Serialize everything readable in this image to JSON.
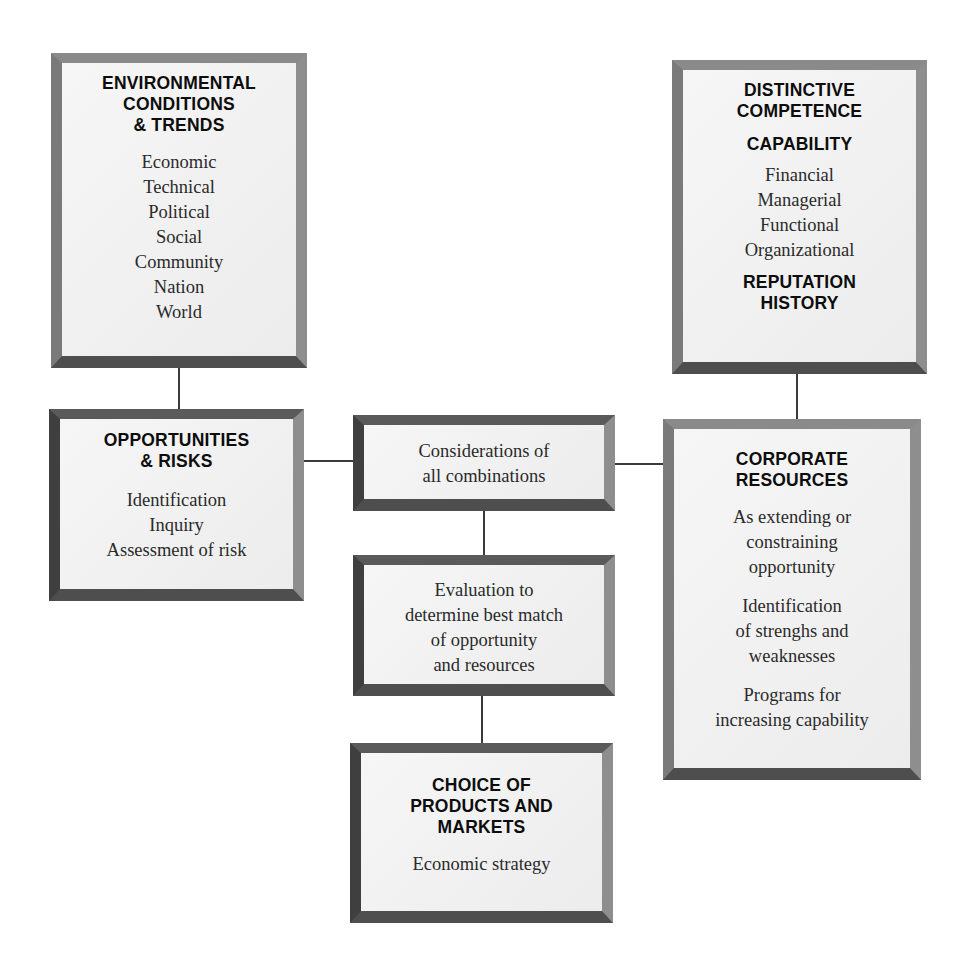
{
  "diagram": {
    "boxes": {
      "environmental": {
        "title": [
          "ENVIRONMENTAL",
          "CONDITIONS",
          "& TRENDS"
        ],
        "items": [
          "Economic",
          "Technical",
          "Political",
          "Social",
          "Community",
          "Nation",
          "World"
        ]
      },
      "distinctive": {
        "title": [
          "DISTINCTIVE",
          "COMPETENCE"
        ],
        "subtitle": "CAPABILITY",
        "items": [
          "Financial",
          "Managerial",
          "Functional",
          "Organizational"
        ],
        "footer": [
          "REPUTATION",
          "HISTORY"
        ]
      },
      "opportunities": {
        "title": [
          "OPPORTUNITIES",
          "& RISKS"
        ],
        "items": [
          "Identification",
          "Inquiry",
          "Assessment of risk"
        ]
      },
      "considerations": {
        "items": [
          "Considerations of",
          "all combinations"
        ]
      },
      "evaluation": {
        "items": [
          "Evaluation to",
          "determine best match",
          "of opportunity",
          "and resources"
        ]
      },
      "corporate": {
        "title": [
          "CORPORATE",
          "RESOURCES"
        ],
        "group1": [
          "As extending or",
          "constraining",
          "opportunity"
        ],
        "group2": [
          "Identification",
          "of strenghs and",
          "weaknesses"
        ],
        "group3": [
          "Programs for",
          "increasing capability"
        ]
      },
      "choice": {
        "title": [
          "CHOICE OF",
          "PRODUCTS AND",
          "MARKETS"
        ],
        "items": [
          "Economic strategy"
        ]
      }
    },
    "connections": [
      [
        "environmental",
        "opportunities"
      ],
      [
        "distinctive",
        "corporate"
      ],
      [
        "opportunities",
        "considerations"
      ],
      [
        "considerations",
        "corporate"
      ],
      [
        "considerations",
        "evaluation"
      ],
      [
        "evaluation",
        "choice"
      ]
    ]
  }
}
